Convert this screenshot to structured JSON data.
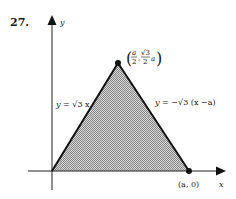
{
  "problem": {
    "number": "27."
  },
  "axes": {
    "x_label": "x",
    "y_label": "y"
  },
  "triangle": {
    "fill": "#b8b8b8",
    "stroke": "#111111",
    "vertices": [
      "(0,0)",
      "(a/2, √3/2 a)",
      "(a,0)"
    ]
  },
  "labels": {
    "left_line": {
      "y": "y",
      "eq": "=",
      "rest": "√3 x"
    },
    "right_line": {
      "y": "y",
      "eq": "=",
      "rest": "−√3 (x −a)"
    },
    "apex": {
      "num1": "a",
      "den1": "2",
      "num2": "√3",
      "den2": "2",
      "tail": "a"
    },
    "base_point": "(a, 0)"
  }
}
